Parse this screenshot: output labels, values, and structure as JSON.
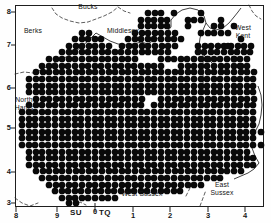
{
  "figure": {
    "kind": "distribution-dot-map",
    "region": "South East England",
    "background_color": "#ffffff",
    "frame_color": "#1a1a1a",
    "dot_color": "#050505",
    "boundary_color": "#222222"
  },
  "axes": {
    "y_ticks": [
      {
        "label": "8",
        "y": 12
      },
      {
        "label": "7",
        "y": 45
      },
      {
        "label": "6",
        "y": 88
      },
      {
        "label": "5",
        "y": 128
      },
      {
        "label": "4",
        "y": 172
      },
      {
        "label": "3",
        "y": 203
      }
    ],
    "x_ticks": [
      {
        "label": "8",
        "x": 16
      },
      {
        "label": "9",
        "x": 57
      },
      {
        "label": "0",
        "x": 95
      },
      {
        "label": "1",
        "x": 133
      },
      {
        "label": "2",
        "x": 170
      },
      {
        "label": "3",
        "x": 208
      },
      {
        "label": "4",
        "x": 245
      }
    ],
    "grid_squares": [
      {
        "code": "SU",
        "x": 76,
        "y": 213
      },
      {
        "code": "TQ",
        "x": 101,
        "y": 213
      }
    ]
  },
  "region_labels": [
    {
      "name": "Bucks",
      "text": "Bucks",
      "x": 88,
      "y": 6
    },
    {
      "name": "Berks",
      "text": "Berks",
      "x": 33,
      "y": 30
    },
    {
      "name": "Middlesex",
      "text": "Middlesex",
      "x": 123,
      "y": 30
    },
    {
      "name": "West Kent",
      "text": "West\nKent",
      "x": 243,
      "y": 30
    },
    {
      "name": "North Hants",
      "text": "North\nHants",
      "x": 24,
      "y": 101
    },
    {
      "name": "West Sussex",
      "text": "West Sussex",
      "x": 142,
      "y": 193
    },
    {
      "name": "East Sussex",
      "text": "East\nSussex",
      "x": 222,
      "y": 186
    }
  ],
  "chart_data": {
    "type": "scatter",
    "title": "",
    "xlabel": "",
    "ylabel": "",
    "xlim": [
      15,
      264
    ],
    "ylim": [
      5,
      207
    ],
    "grid": false,
    "legend": null,
    "marker": {
      "shape": "circle",
      "filled": true,
      "radius": 3.35,
      "spacing": 6.6
    },
    "note": "Filled circles mark 10km-square presence records; dashed lines are vice-county boundaries; thin solid lines are coastline and river Thames.",
    "dot_rows": [
      {
        "y": 13,
        "runs": [
          [
            148,
            165
          ]
        ]
      },
      {
        "y": 20,
        "runs": [
          [
            141,
            171
          ],
          [
            194,
            201
          ]
        ]
      },
      {
        "y": 26,
        "runs": [
          [
            141,
            171
          ],
          [
            188,
            194
          ],
          [
            214,
            221
          ]
        ]
      },
      {
        "y": 33,
        "runs": [
          [
            82,
            95
          ],
          [
            135,
            178
          ],
          [
            201,
            208
          ],
          [
            221,
            228
          ]
        ]
      },
      {
        "y": 39,
        "runs": [
          [
            75,
            102
          ],
          [
            128,
            184
          ]
        ]
      },
      {
        "y": 46,
        "runs": [
          [
            69,
            115
          ],
          [
            122,
            184
          ],
          [
            198,
            251
          ]
        ]
      },
      {
        "y": 52,
        "runs": [
          [
            62,
            128
          ],
          [
            135,
            171
          ],
          [
            191,
            251
          ]
        ]
      },
      {
        "y": 59,
        "runs": [
          [
            49,
            141
          ],
          [
            161,
            251
          ]
        ]
      },
      {
        "y": 66,
        "runs": [
          [
            42,
            161
          ],
          [
            181,
            251
          ]
        ]
      },
      {
        "y": 72,
        "runs": [
          [
            36,
            254
          ]
        ]
      },
      {
        "y": 79,
        "runs": [
          [
            29,
            254
          ]
        ]
      },
      {
        "y": 86,
        "runs": [
          [
            29,
            258
          ]
        ]
      },
      {
        "y": 92,
        "runs": [
          [
            29,
            258
          ]
        ]
      },
      {
        "y": 99,
        "runs": [
          [
            36,
            258
          ]
        ]
      },
      {
        "y": 105,
        "runs": [
          [
            29,
            258
          ]
        ]
      },
      {
        "y": 112,
        "runs": [
          [
            22,
            258
          ]
        ]
      },
      {
        "y": 119,
        "runs": [
          [
            22,
            258
          ]
        ]
      },
      {
        "y": 125,
        "runs": [
          [
            22,
            258
          ]
        ]
      },
      {
        "y": 132,
        "runs": [
          [
            22,
            258
          ]
        ]
      },
      {
        "y": 138,
        "runs": [
          [
            22,
            254
          ]
        ]
      },
      {
        "y": 145,
        "runs": [
          [
            22,
            254
          ]
        ]
      },
      {
        "y": 152,
        "runs": [
          [
            29,
            248
          ]
        ]
      },
      {
        "y": 158,
        "runs": [
          [
            29,
            254
          ]
        ]
      },
      {
        "y": 165,
        "runs": [
          [
            29,
            254
          ]
        ]
      },
      {
        "y": 171,
        "runs": [
          [
            36,
            241
          ]
        ]
      },
      {
        "y": 178,
        "runs": [
          [
            42,
            221
          ]
        ]
      },
      {
        "y": 185,
        "runs": [
          [
            49,
            201
          ]
        ]
      },
      {
        "y": 191,
        "runs": [
          [
            55,
            181
          ]
        ]
      },
      {
        "y": 198,
        "runs": [
          [
            62,
            115
          ]
        ]
      },
      {
        "y": 203,
        "runs": [
          [
            69,
            82
          ]
        ]
      }
    ],
    "extra_dots": [
      [
        201,
        13
      ],
      [
        221,
        20
      ],
      [
        234,
        26
      ],
      [
        214,
        33
      ],
      [
        241,
        39
      ],
      [
        228,
        46
      ],
      [
        234,
        59
      ],
      [
        241,
        66
      ],
      [
        261,
        132
      ],
      [
        261,
        145
      ],
      [
        208,
        59
      ],
      [
        188,
        20
      ],
      [
        174,
        13
      ]
    ],
    "holes": [
      [
        181,
        46
      ],
      [
        188,
        46
      ],
      [
        181,
        52
      ],
      [
        188,
        52
      ],
      [
        148,
        99
      ],
      [
        155,
        99
      ],
      [
        148,
        105
      ]
    ]
  }
}
